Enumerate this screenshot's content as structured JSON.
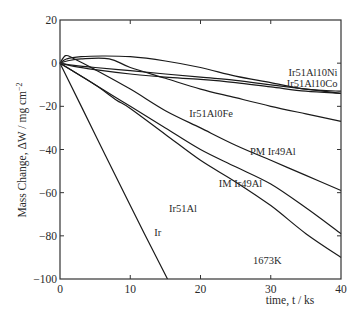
{
  "chart_data": {
    "type": "line",
    "title": "",
    "xlabel": "time, t / ks",
    "ylabel": "Mass Change, ΔW / mg cm⁻²",
    "xlim": [
      0,
      40
    ],
    "ylim": [
      -100,
      20
    ],
    "xticks": [
      0,
      10,
      20,
      30,
      40
    ],
    "yticks": [
      20,
      0,
      -20,
      -40,
      -60,
      -80,
      -100
    ],
    "grid": false,
    "legend": "inline labels",
    "annotations": [
      "1673K"
    ],
    "series": [
      {
        "name": "Ir",
        "x": [
          0,
          5,
          10,
          15.3
        ],
        "y": [
          0,
          -33,
          -66,
          -100
        ]
      },
      {
        "name": "Ir51Al10Ni",
        "x": [
          0,
          1,
          3,
          6,
          10,
          15,
          20,
          25,
          30,
          35,
          40
        ],
        "y": [
          0,
          2,
          3,
          3.3,
          3,
          1,
          -2,
          -6,
          -9,
          -12,
          -13
        ]
      },
      {
        "name": "Ir51Al10Co",
        "x": [
          0,
          2,
          5,
          10,
          15,
          20,
          25,
          30,
          35,
          40
        ],
        "y": [
          0,
          -1,
          -2,
          -3.5,
          -5,
          -6.5,
          -8,
          -10,
          -12,
          -14
        ]
      },
      {
        "name": "Ir51Al10Co-b",
        "x": [
          0,
          2,
          5,
          10,
          15,
          20,
          25,
          30,
          35,
          40
        ],
        "y": [
          0,
          -1.5,
          -3,
          -5,
          -6.5,
          -7.5,
          -9,
          -11,
          -13,
          -14
        ]
      },
      {
        "name": "Ir51Al0Fe",
        "x": [
          0,
          1,
          3,
          7,
          10,
          15,
          20,
          25,
          30,
          35,
          40
        ],
        "y": [
          0,
          1,
          2,
          2,
          -2,
          -7,
          -12,
          -16,
          -20,
          -23.5,
          -27
        ]
      },
      {
        "name": "PM Ir49Al",
        "x": [
          0,
          0.8,
          2,
          5,
          10,
          15,
          20,
          25,
          30,
          35,
          40
        ],
        "y": [
          0,
          3.5,
          2,
          -3,
          -12,
          -22,
          -30,
          -38,
          -45,
          -52,
          -59
        ]
      },
      {
        "name": "IM Ir49Al",
        "x": [
          0,
          2,
          5,
          8,
          10,
          15,
          20,
          25,
          30,
          35,
          40
        ],
        "y": [
          0,
          -4,
          -10,
          -16,
          -20,
          -30,
          -40,
          -48,
          -56,
          -67,
          -79
        ]
      },
      {
        "name": "Ir51Al",
        "x": [
          0,
          2,
          5,
          8,
          10,
          15,
          20,
          25,
          30,
          35,
          40
        ],
        "y": [
          0,
          -4,
          -10,
          -17,
          -21,
          -33,
          -45,
          -55,
          -66,
          -79,
          -90
        ]
      }
    ],
    "labels": [
      {
        "text": "Ir51Al10Ni",
        "x": 39.5,
        "y": -4,
        "anchor": "end"
      },
      {
        "text": "Ir51Al10Co",
        "x": 39.5,
        "y": -9,
        "anchor": "end"
      },
      {
        "text": "Ir51Al0Fe",
        "x": 21.5,
        "y": -23,
        "anchor": "middle"
      },
      {
        "text": "PM Ir49Al",
        "x": 30.3,
        "y": -40.5,
        "anchor": "middle"
      },
      {
        "text": "IM Ir49Al",
        "x": 25.7,
        "y": -55.5,
        "anchor": "middle"
      },
      {
        "text": "Ir51Al",
        "x": 17.5,
        "y": -67,
        "anchor": "middle"
      },
      {
        "text": "Ir",
        "x": 13.9,
        "y": -78,
        "anchor": "middle"
      },
      {
        "text": "1673K",
        "x": 29.5,
        "y": -91,
        "anchor": "middle"
      }
    ]
  }
}
